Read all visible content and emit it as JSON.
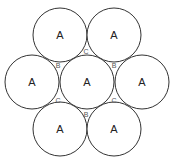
{
  "diagram": {
    "title": "",
    "circles": [
      {
        "id": "top-left",
        "label": "A",
        "cx": 60,
        "cy": 35,
        "r": 27
      },
      {
        "id": "top-right",
        "label": "A",
        "cx": 114,
        "cy": 35,
        "r": 27
      },
      {
        "id": "mid-left",
        "label": "A",
        "cx": 32,
        "cy": 82,
        "r": 27
      },
      {
        "id": "center",
        "label": "A",
        "cx": 87,
        "cy": 82,
        "r": 27
      },
      {
        "id": "mid-right",
        "label": "A",
        "cx": 142,
        "cy": 82,
        "r": 27
      },
      {
        "id": "bottom-left",
        "label": "A",
        "cx": 60,
        "cy": 129,
        "r": 27
      },
      {
        "id": "bottom-right",
        "label": "A",
        "cx": 114,
        "cy": 129,
        "r": 27
      }
    ],
    "interstitial_labels": [
      {
        "id": "c-top",
        "label": "C",
        "x": 86,
        "y": 51
      },
      {
        "id": "b-upper-left",
        "label": "B",
        "x": 58,
        "y": 65
      },
      {
        "id": "b-upper-right",
        "label": "B",
        "x": 114,
        "y": 65
      },
      {
        "id": "c-lower-left",
        "label": "C",
        "x": 58,
        "y": 100
      },
      {
        "id": "c-lower-right",
        "label": "C",
        "x": 114,
        "y": 100
      },
      {
        "id": "b-bottom",
        "label": "B",
        "x": 86,
        "y": 114
      }
    ],
    "colors": {
      "stroke": "#333333",
      "fill": "#ffffff",
      "text": "#222222"
    }
  }
}
